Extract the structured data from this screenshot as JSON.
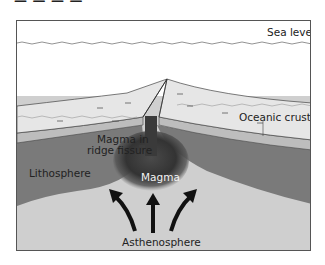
{
  "diagram": {
    "title_fragment": "— — — —",
    "labels": {
      "sea_level": "Sea level",
      "oceanic_crust": "Oceanic crust",
      "magma_fissure_line1": "Magma in",
      "magma_fissure_line2": "ridge fissure",
      "lithosphere": "Lithosphere",
      "magma": "Magma",
      "asthenosphere": "Asthenosphere"
    },
    "arrows": [
      "curved-up-left",
      "straight-up",
      "curved-up-right"
    ],
    "colors": {
      "water": "#ffffff",
      "seafloor_sediment": "#e6e6e6",
      "crust_band": "#bdbdbd",
      "lithosphere": "#7a7a7a",
      "magma": "#3a3a3a",
      "asthenosphere": "#cfcfcf",
      "frame": "#555555"
    }
  }
}
